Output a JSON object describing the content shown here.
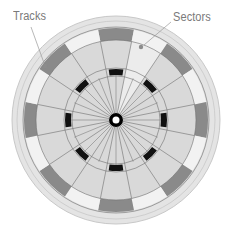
{
  "labels": {
    "tracks": "Tracks",
    "sectors": "Sectors"
  },
  "diagram": {
    "type": "hard-disk-platter",
    "sector_count": 16,
    "highlighted_sector_index": 1,
    "colors": {
      "platter": "#d9d9d9",
      "platter_edge": "#c8c8c8",
      "rim": "#e4e4e4",
      "outer_track_dark": "#8a8a8a",
      "outer_track_light": "#f2f2f2",
      "inner_track_dark": "#111111",
      "inner_track_light": "#dcdcdc",
      "highlight_sector": "#ececec",
      "lines": "#6e6e6e",
      "hub": "#000000",
      "label_text": "#7a7a7a",
      "leader_line": "#9a9a9a"
    }
  }
}
